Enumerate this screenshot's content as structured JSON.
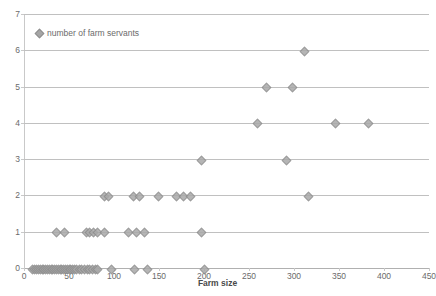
{
  "chart_data": {
    "type": "scatter",
    "title": "",
    "xlabel": "Farm size",
    "ylabel": "",
    "xlim": [
      0,
      450
    ],
    "ylim": [
      0,
      7
    ],
    "grid": true,
    "legend_position": "top-left",
    "legend": [
      "number of farm servants"
    ],
    "xticks": [
      0,
      50,
      100,
      150,
      200,
      250,
      300,
      350,
      400,
      450
    ],
    "yticks": [
      0,
      1,
      2,
      3,
      4,
      5,
      6,
      7
    ],
    "marker_color": "#a9a9a9",
    "gridline_color": "#c0c0c0",
    "series": [
      {
        "name": "number of farm servants",
        "points": [
          [
            8,
            0
          ],
          [
            11,
            0
          ],
          [
            13,
            0
          ],
          [
            15,
            0
          ],
          [
            17,
            0
          ],
          [
            19,
            0
          ],
          [
            21,
            0
          ],
          [
            23,
            0
          ],
          [
            25,
            0
          ],
          [
            27,
            0
          ],
          [
            29,
            0
          ],
          [
            31,
            0
          ],
          [
            33,
            0
          ],
          [
            35,
            0
          ],
          [
            37,
            0
          ],
          [
            39,
            0
          ],
          [
            41,
            0
          ],
          [
            43,
            0
          ],
          [
            45,
            0
          ],
          [
            47,
            0
          ],
          [
            49,
            0
          ],
          [
            51,
            0
          ],
          [
            53,
            0
          ],
          [
            55,
            0
          ],
          [
            57,
            0
          ],
          [
            60,
            0
          ],
          [
            63,
            0
          ],
          [
            66,
            0
          ],
          [
            69,
            0
          ],
          [
            72,
            0
          ],
          [
            75,
            0
          ],
          [
            78,
            0
          ],
          [
            81,
            0
          ],
          [
            96,
            0
          ],
          [
            122,
            0
          ],
          [
            136,
            0
          ],
          [
            199,
            0
          ],
          [
            35,
            1
          ],
          [
            44,
            1
          ],
          [
            68,
            1
          ],
          [
            72,
            1
          ],
          [
            76,
            1
          ],
          [
            80,
            1
          ],
          [
            88,
            1
          ],
          [
            115,
            1
          ],
          [
            124,
            1
          ],
          [
            133,
            1
          ],
          [
            196,
            1
          ],
          [
            88,
            2
          ],
          [
            93,
            2
          ],
          [
            120,
            2
          ],
          [
            127,
            2
          ],
          [
            148,
            2
          ],
          [
            168,
            2
          ],
          [
            176,
            2
          ],
          [
            184,
            2
          ],
          [
            315,
            2
          ],
          [
            196,
            3
          ],
          [
            290,
            3
          ],
          [
            258,
            4
          ],
          [
            345,
            4
          ],
          [
            382,
            4
          ],
          [
            268,
            5
          ],
          [
            297,
            5
          ],
          [
            310,
            6
          ]
        ]
      }
    ]
  },
  "axis": {
    "x_label": "Farm size"
  }
}
